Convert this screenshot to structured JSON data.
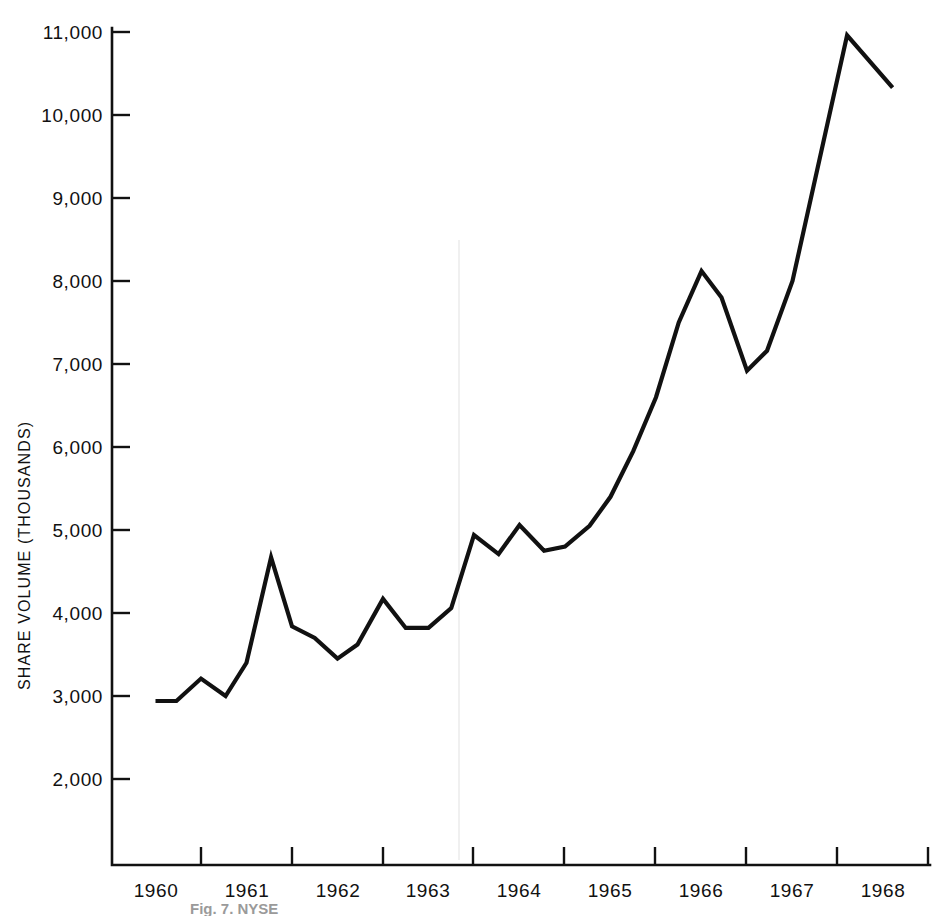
{
  "figure": {
    "caption": "Fig. 7. NYSE",
    "background_color": "#ffffff",
    "line_color": "#111111"
  },
  "chart_data": {
    "type": "line",
    "title": "",
    "subtitle": "",
    "xlabel": "",
    "ylabel": "SHARE VOLUME (THOUSANDS)",
    "grid": false,
    "legend": "none",
    "xlim": [
      1959.5,
      1968.2
    ],
    "ylim": [
      1400,
      11400
    ],
    "ytick_labels": [
      "2,000",
      "3,000",
      "4,000",
      "5,000",
      "6,000",
      "7,000",
      "8,000",
      "9,000",
      "10,000",
      "11,000"
    ],
    "ytick_values": [
      2000,
      3000,
      4000,
      5000,
      6000,
      7000,
      8000,
      9000,
      10000,
      11000
    ],
    "xtick_labels": [
      "1960",
      "1961",
      "1962",
      "1963",
      "1964",
      "1965",
      "1966",
      "1967",
      "1968"
    ],
    "xtick_values": [
      1960,
      1961,
      1962,
      1963,
      1964,
      1965,
      1966,
      1967,
      1968
    ],
    "series": [
      {
        "name": "Share volume",
        "x": [
          1959.5,
          1959.73,
          1960.0,
          1960.27,
          1960.5,
          1960.77,
          1961.0,
          1961.25,
          1961.5,
          1961.72,
          1962.0,
          1962.25,
          1962.5,
          1962.75,
          1963.0,
          1963.27,
          1963.5,
          1963.77,
          1964.0,
          1964.27,
          1964.5,
          1964.75,
          1965.0,
          1965.25,
          1965.5,
          1965.72,
          1966.0,
          1966.22,
          1966.5,
          1967.1,
          1967.6
        ],
        "y": [
          2940,
          2940,
          3210,
          3000,
          3400,
          4670,
          3840,
          3700,
          3450,
          3620,
          4170,
          3820,
          3820,
          4060,
          4940,
          4710,
          5060,
          4750,
          4800,
          5050,
          5400,
          5950,
          6600,
          7500,
          8120,
          7800,
          6920,
          7160,
          8000,
          10960,
          10330
        ]
      }
    ],
    "annotations": []
  }
}
